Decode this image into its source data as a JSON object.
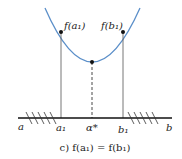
{
  "diagram": {
    "caption": "c) f(a₁) = f(b₁)",
    "curve_color": "#5b8fc9",
    "point_labels": {
      "left": "f(a₁)",
      "right": "f(b₁)"
    },
    "axis_labels": {
      "a": "a",
      "a1": "a₁",
      "alpha_star": "α*",
      "b1": "b₁",
      "b": "b"
    }
  }
}
